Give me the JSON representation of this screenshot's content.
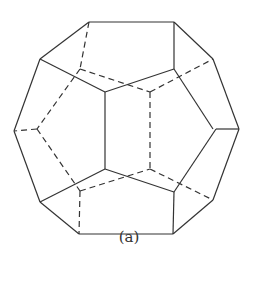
{
  "figure": {
    "caption": "(a)",
    "stroke_color": "#333333",
    "solid_edges": [
      [
        89,
        22,
        174,
        22
      ],
      [
        89,
        22,
        40,
        59
      ],
      [
        174,
        22,
        213,
        59
      ],
      [
        174,
        22,
        174,
        69
      ],
      [
        40,
        59,
        105,
        92
      ],
      [
        105,
        92,
        174,
        69
      ],
      [
        174,
        69,
        213,
        129
      ],
      [
        213,
        59,
        239,
        129
      ],
      [
        40,
        59,
        14,
        131
      ],
      [
        105,
        92,
        105,
        169
      ],
      [
        14,
        131,
        40,
        202
      ],
      [
        239,
        129,
        213,
        200
      ],
      [
        239,
        129,
        216,
        129
      ],
      [
        216,
        129,
        174,
        192
      ],
      [
        105,
        169,
        40,
        202
      ],
      [
        105,
        169,
        174,
        192
      ],
      [
        174,
        192,
        173,
        234
      ],
      [
        40,
        202,
        79,
        234
      ],
      [
        79,
        234,
        173,
        234
      ],
      [
        173,
        234,
        213,
        200
      ]
    ],
    "dashed_edges": [
      [
        89,
        22,
        80,
        69
      ],
      [
        80,
        69,
        37,
        129
      ],
      [
        37,
        129,
        14,
        131
      ],
      [
        80,
        69,
        150,
        92
      ],
      [
        150,
        92,
        213,
        59
      ],
      [
        150,
        92,
        150,
        169
      ],
      [
        37,
        129,
        80,
        191
      ],
      [
        80,
        191,
        150,
        169
      ],
      [
        80,
        191,
        79,
        234
      ],
      [
        150,
        169,
        213,
        200
      ]
    ]
  }
}
